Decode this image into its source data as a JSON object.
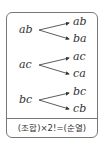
{
  "trees": [
    {
      "root": "ab",
      "branches": [
        "ab",
        "ba"
      ]
    },
    {
      "root": "ac",
      "branches": [
        "ac",
        "ca"
      ]
    },
    {
      "root": "bc",
      "branches": [
        "bc",
        "cb"
      ]
    }
  ],
  "formula": "(조합)×2!=(순열)"
}
